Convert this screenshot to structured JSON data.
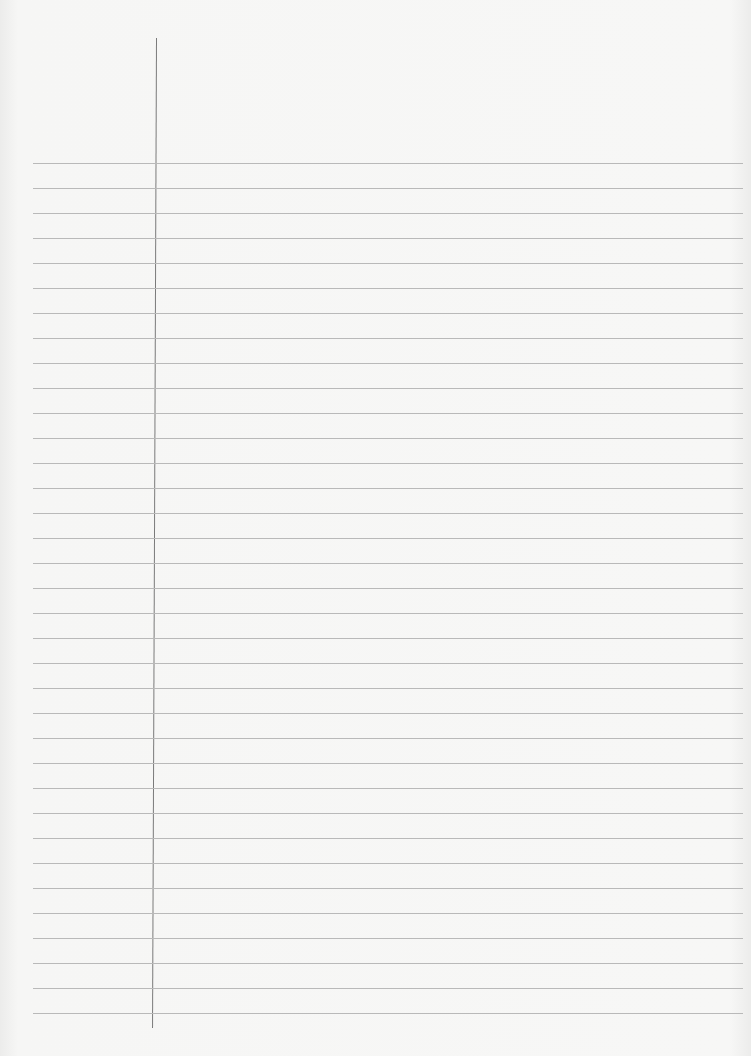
{
  "page": {
    "type": "blank-lined-paper",
    "background_color": "#f6f6f5",
    "rule_color": "#b9b9b9",
    "margin_line_color": "#7a7a7a",
    "rule_count": 35,
    "rule_start_y": 163,
    "rule_spacing": 25
  }
}
